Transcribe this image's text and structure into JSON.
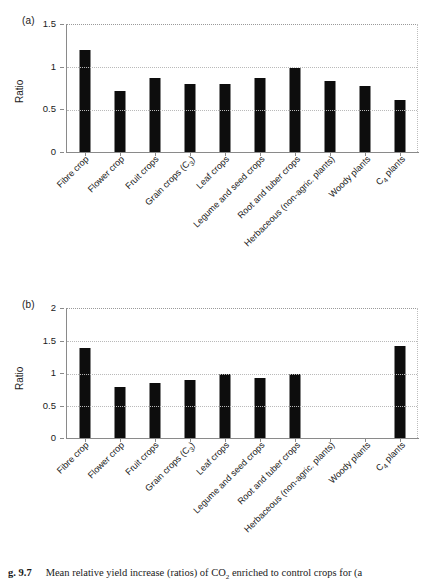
{
  "figure": {
    "caption_label": "g. 9.7",
    "caption_text": "Mean relative yield increase (ratios) of CO2 enriched to control crops for (a"
  },
  "chart_data": [
    {
      "type": "bar",
      "panel": "(a)",
      "title": "",
      "xlabel": "",
      "ylabel": "Ratio",
      "ylim": [
        0,
        1.5
      ],
      "yticks": [
        "0",
        "0.5",
        "1",
        "1.5"
      ],
      "ytick_values": [
        0,
        0.5,
        1,
        1.5
      ],
      "grid": true,
      "legend": "none",
      "categories": [
        "Fibre crop",
        "Flower crop",
        "Fruit crops",
        "Grain crops (C3)",
        "Leaf crops",
        "Legume and seed crops",
        "Root and tuber crops",
        "Herbaceous (non-agric. plants)",
        "Woody plants",
        "C4 plants"
      ],
      "values": [
        1.21,
        0.72,
        0.88,
        0.8,
        0.8,
        0.88,
        0.99,
        0.84,
        0.78,
        0.62
      ]
    },
    {
      "type": "bar",
      "panel": "(b)",
      "title": "",
      "xlabel": "",
      "ylabel": "Ratio",
      "ylim": [
        0,
        2
      ],
      "yticks": [
        "0",
        "0.5",
        "1",
        "1.5",
        "2"
      ],
      "ytick_values": [
        0,
        0.5,
        1,
        1.5,
        2
      ],
      "grid": true,
      "legend": "none",
      "categories": [
        "Fibre crop",
        "Flower crop",
        "Fruit crops",
        "Grain crops (C3)",
        "Leaf crops",
        "Legume and seed crops",
        "Root and tuber crops",
        "Herbaceous (non-agric. plants)",
        "Woody plants",
        "C4 plants"
      ],
      "values": [
        1.39,
        0.79,
        0.86,
        0.9,
        0.99,
        0.93,
        0.99,
        null,
        null,
        1.43
      ]
    }
  ],
  "colors": {
    "bar": "#0d0d0d",
    "axis": "#8a8a8a",
    "grid": "#b9b9b9",
    "text": "#1a1a1a",
    "background": "#ffffff"
  }
}
